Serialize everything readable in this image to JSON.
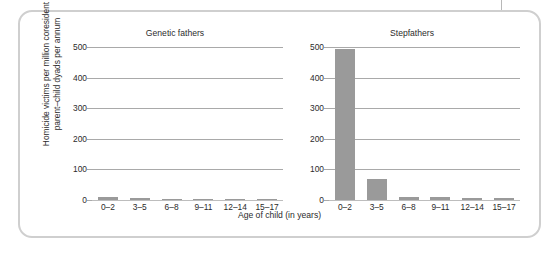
{
  "figure": {
    "y_axis_title": "Homicide victims per million coresident\nparent–child dyads per annum",
    "x_axis_title": "Age of child (in years)",
    "bar_color": "#9a9a9a",
    "gridline_color": "#a9a9a9",
    "border_color": "#cfcfcf"
  },
  "chart_data": [
    {
      "type": "bar",
      "title": "Genetic fathers",
      "categories": [
        "0–2",
        "3–5",
        "6–8",
        "9–11",
        "12–14",
        "15–17"
      ],
      "values": [
        11,
        5,
        2,
        3,
        2,
        2
      ],
      "xlabel": "Age of child (in years)",
      "ylabel": "Homicide victims per million coresident parent–child dyads per annum",
      "ylim": [
        0,
        500
      ],
      "yticks": [
        0,
        100,
        200,
        300,
        400,
        500
      ],
      "ytick_labels": [
        "0",
        "100",
        "200",
        "300",
        "400",
        "500"
      ],
      "grid": true,
      "legend": "none"
    },
    {
      "type": "bar",
      "title": "Stepfathers",
      "categories": [
        "0–2",
        "3–5",
        "6–8",
        "9–11",
        "12–14",
        "15–17"
      ],
      "values": [
        492,
        69,
        9,
        11,
        6,
        5
      ],
      "xlabel": "Age of child (in years)",
      "ylabel": "Homicide victims per million coresident parent–child dyads per annum",
      "ylim": [
        0,
        500
      ],
      "yticks": [
        0,
        100,
        200,
        300,
        400,
        500
      ],
      "ytick_labels": [
        "0",
        "100",
        "200",
        "300",
        "400",
        "500"
      ],
      "grid": true,
      "legend": "none"
    }
  ]
}
